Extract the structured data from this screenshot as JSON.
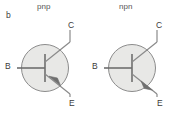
{
  "figure": {
    "part_label": "b",
    "caption_left": "pnp",
    "caption_right": "npn",
    "colors": {
      "background": "#ffffff",
      "circle_fill": "#e8e8e6",
      "circle_stroke": "#8c8c8c",
      "lead_stroke": "#6f6f6f",
      "text": "#3b3b3b",
      "caption_text": "#555555"
    }
  },
  "symbols": [
    {
      "id": "pnp-transistor",
      "type": "pnp",
      "caption": "pnp",
      "arrow_direction": "inward",
      "terminals": {
        "base": "B",
        "collector": "C",
        "emitter": "E"
      },
      "circle": {
        "cx": 45,
        "cy": 68,
        "r": 23.5
      }
    },
    {
      "id": "npn-transistor",
      "type": "npn",
      "caption": "npn",
      "arrow_direction": "outward",
      "terminals": {
        "base": "B",
        "collector": "C",
        "emitter": "E"
      },
      "circle": {
        "cx": 132,
        "cy": 68,
        "r": 23.5
      }
    }
  ]
}
